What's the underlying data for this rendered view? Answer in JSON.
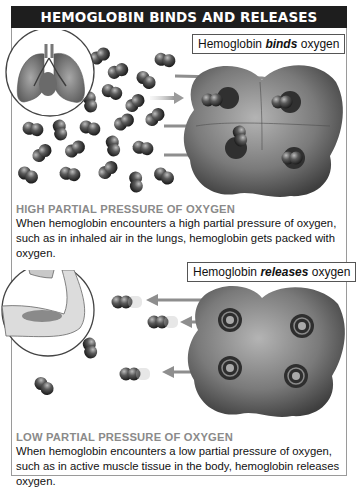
{
  "title": "HEMOGLOBIN BINDS AND RELEASES OXYGEN",
  "panels": [
    {
      "id": "binds",
      "label_prefix": "Hemoglobin ",
      "label_emphasis": "binds",
      "label_suffix": " oxygen",
      "inset": "lungs",
      "heading": "HIGH PARTIAL PRESSURE OF OXYGEN",
      "body": "When hemoglobin encounters a high partial pressure of oxygen, such as in inhaled air in the lungs, hemoglobin gets packed with oxygen.",
      "arrow_direction": "into-hemoglobin"
    },
    {
      "id": "releases",
      "label_prefix": "Hemoglobin ",
      "label_emphasis": "releases",
      "label_suffix": " oxygen",
      "inset": "flexed-arm-muscle",
      "heading": "LOW PARTIAL PRESSURE OF OXYGEN",
      "body": "When hemoglobin encounters a low partial pressure of oxygen, such as in active muscle tissue in the body, hemoglobin releases oxygen.",
      "arrow_direction": "out-of-hemoglobin"
    }
  ],
  "colors": {
    "title_bar": "#1e1e1e",
    "heading_gray": "#8a8a8a",
    "frame_border": "#9a9a9a",
    "molecule": "#4a4a4a",
    "protein": "#7d7d7d"
  }
}
